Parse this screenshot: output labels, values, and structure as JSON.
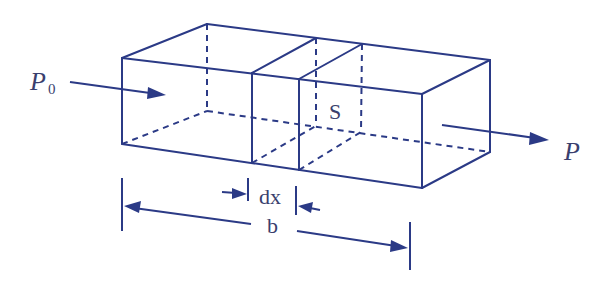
{
  "diagram": {
    "type": "rectangular-prism-with-slice",
    "colors": {
      "line": "#2b3a86",
      "text": "#3a3f6e",
      "background": "#ffffff"
    },
    "labels": {
      "input_power": "P",
      "input_power_subscript": "0",
      "output_power": "P",
      "slice_area": "S",
      "slice_thickness": "dx",
      "length": "b"
    }
  }
}
